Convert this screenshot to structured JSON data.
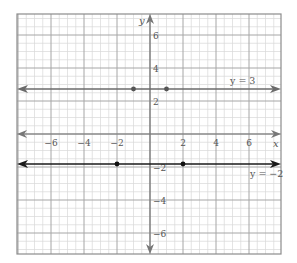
{
  "graph": {
    "x_axis_label": "x",
    "y_axis_label": "y",
    "x_ticks": [
      {
        "value": -6,
        "label": "−6"
      },
      {
        "value": -4,
        "label": "−4"
      },
      {
        "value": -2,
        "label": "−2"
      },
      {
        "value": 2,
        "label": "2"
      },
      {
        "value": 4,
        "label": "4"
      },
      {
        "value": 6,
        "label": "6"
      }
    ],
    "y_ticks": [
      {
        "value": 6,
        "label": "6"
      },
      {
        "value": 4,
        "label": "4"
      },
      {
        "value": 2,
        "label": "2"
      },
      {
        "value": -2,
        "label": "−2"
      },
      {
        "value": -4,
        "label": "−4"
      },
      {
        "value": -6,
        "label": "−6"
      }
    ],
    "lines": [
      {
        "equation": "y = 3",
        "y": 3,
        "color": "#6b6b6b",
        "points": [
          [
            -1,
            3
          ],
          [
            1,
            3
          ]
        ]
      },
      {
        "equation": "y = −2",
        "y": -2,
        "color": "#1a1a1a",
        "points": [
          [
            -2,
            -2
          ],
          [
            2,
            -2
          ]
        ]
      }
    ],
    "colors": {
      "minor_grid": "#d9d9d9",
      "major_grid": "#a6a6a6",
      "axis": "#777777",
      "border": "#8c8c8c"
    }
  }
}
